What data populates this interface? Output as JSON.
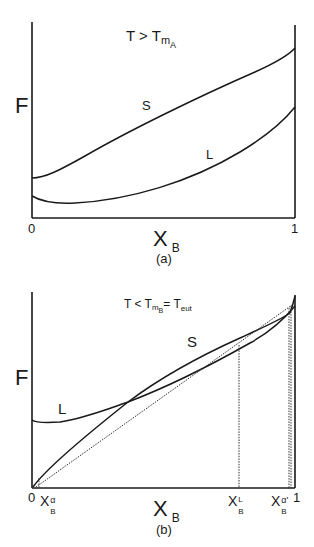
{
  "panel_a": {
    "title": {
      "main": "T  >  T",
      "sub1": "m",
      "sub2": "A"
    },
    "y_label": "F",
    "x_label": {
      "main": "X",
      "sub": "B"
    },
    "x_ticks": [
      "0",
      "1"
    ],
    "curve_labels": {
      "solid": "S",
      "liquid": "L"
    },
    "caption": "(a)"
  },
  "panel_b": {
    "title": {
      "p1": "T < T",
      "sub1": "m",
      "sub2": "B",
      "p2": "= T",
      "sub3": "eut"
    },
    "y_label": "F",
    "x_label": {
      "main": "X",
      "sub": "B"
    },
    "x_ticks": [
      "0",
      "1"
    ],
    "marks": [
      {
        "main": "X",
        "sub": "B",
        "sup": "α"
      },
      {
        "main": "X",
        "sub": "B",
        "sup": "L"
      },
      {
        "main": "X",
        "sub": "B",
        "sup": "α'"
      }
    ],
    "curve_labels": {
      "solid": "S",
      "liquid": "L"
    },
    "caption": "(b)"
  },
  "colors": {
    "line": "#1a1a1a",
    "background": "#ffffff"
  }
}
